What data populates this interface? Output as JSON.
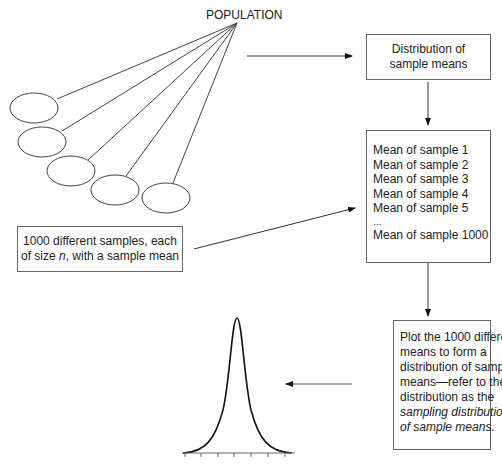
{
  "population_label": "POPULATION",
  "distribution_box": {
    "line1": "Distribution of",
    "line2": "sample means"
  },
  "means_box": {
    "items": [
      "Mean of sample 1",
      "Mean of sample 2",
      "Mean of sample 3",
      "Mean of sample 4",
      "Mean of sample 5",
      "…",
      "Mean of sample 1000"
    ]
  },
  "samples_box": {
    "line1": "1000 different samples, each",
    "line2_pre": "of size ",
    "line2_var": "n",
    "line2_post": ", with a sample mean"
  },
  "plot_box": {
    "lines": [
      "Plot the 1000 different",
      "means to form a",
      "distribution of sample",
      "means—refer to the",
      "distribution as the"
    ],
    "italic_lines": [
      "sampling distribution",
      "of sample means."
    ]
  },
  "samples_count": 5,
  "curve": {
    "type": "normal",
    "ticks": 7
  }
}
